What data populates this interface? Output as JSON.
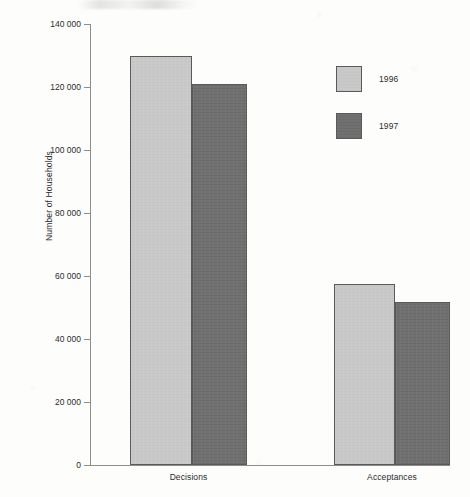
{
  "chart_data": {
    "type": "bar",
    "title": "",
    "subtitle": "",
    "xlabel": "",
    "ylabel": "Number of Households",
    "categories": [
      "Decisions",
      "Acceptances"
    ],
    "series": [
      {
        "name": "1996",
        "color": "#c9c9c9",
        "values": [
          130000,
          57500
        ]
      },
      {
        "name": "1997",
        "color": "#707070",
        "values": [
          121000,
          51700
        ]
      }
    ],
    "ylim": [
      0,
      140000
    ],
    "ytick_values": [
      140000,
      120000,
      100000,
      80000,
      60000,
      40000,
      20000,
      0
    ],
    "ytick_labels": [
      "140 000",
      "120 000",
      "100 000",
      "80 000",
      "60 000",
      "40 000",
      "20 000",
      "0"
    ],
    "grid": false,
    "legend_position": "upper right (inside plot)",
    "bar_grouping": "adjacent, no gap within group"
  },
  "axis": {
    "y_title": "Number of Households"
  },
  "legend": {
    "entries": [
      {
        "label": "1996",
        "swatch": "light-gray-swatch"
      },
      {
        "label": "1997",
        "swatch": "dark-gray-swatch"
      }
    ]
  },
  "x_axis": {
    "categories": [
      {
        "label": "Decisions"
      },
      {
        "label": "Acceptances"
      }
    ]
  },
  "y_axis": {
    "ticks": [
      {
        "label": "140 000",
        "value": 140000
      },
      {
        "label": "120 000",
        "value": 120000
      },
      {
        "label": "100 000",
        "value": 100000
      },
      {
        "label": "80 000",
        "value": 80000
      },
      {
        "label": "60 000",
        "value": 60000
      },
      {
        "label": "40 000",
        "value": 40000
      },
      {
        "label": "20 000",
        "value": 20000
      },
      {
        "label": "0",
        "value": 0
      }
    ]
  },
  "colors": {
    "series_1996": "#c9c9c9",
    "series_1997": "#707070",
    "axis_line": "#8d8d8d",
    "bar_border": "#5a5a5a",
    "text": "#2c2c2c",
    "page_background": "#fdfdfc"
  }
}
